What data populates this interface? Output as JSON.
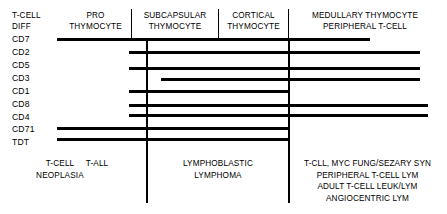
{
  "diagram": {
    "width": 447,
    "height": 214,
    "line_color": "#000000",
    "background": "#ffffff"
  },
  "header": {
    "left_label_line1": "T-CELL",
    "left_label_line2": "DIFF",
    "columns": [
      {
        "line1": "PRO",
        "line2": "THYMOCYTE"
      },
      {
        "line1": "SUBCAPSULAR",
        "line2": "THYMOCYTE"
      },
      {
        "line1": "CORTICAL",
        "line2": "THYMOCYTE"
      },
      {
        "line1": "MEDULLARY THYMOCYTE",
        "line2": "PERIPHERAL T-CELL"
      }
    ]
  },
  "markers": [
    {
      "label": "CD7",
      "start": 57,
      "end": 370
    },
    {
      "label": "CD2",
      "start": 129,
      "end": 420
    },
    {
      "label": "CD5",
      "start": 129,
      "end": 420
    },
    {
      "label": "CD3",
      "start": 161,
      "end": 420
    },
    {
      "label": "CD1",
      "start": 129,
      "end": 288
    },
    {
      "label": "CD8",
      "start": 129,
      "end": 428
    },
    {
      "label": "CD4",
      "start": 129,
      "end": 428
    },
    {
      "label": "CD71",
      "start": 57,
      "end": 288
    },
    {
      "label": "TDT",
      "start": 57,
      "end": 288
    }
  ],
  "footer": {
    "left_label_line1": "T-CELL",
    "left_label_line2": "NEOPLASIA",
    "t_all": "T-ALL",
    "lymphoblastic_line1": "LYMPHOBLASTIC",
    "lymphoblastic_line2": "LYMPHOMA",
    "right_block": [
      "T-CLL, MYC FUNG/SEZARY SYN",
      "PERIPHERAL T-CELL LYM",
      "ADULT T-CELL LEUK/LYM",
      "ANGIOCENTRIC LYM"
    ]
  }
}
